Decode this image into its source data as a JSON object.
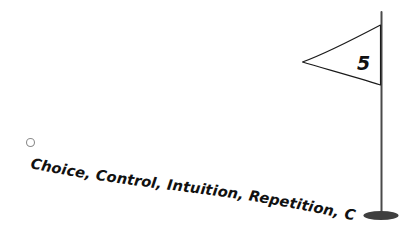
{
  "scene": {
    "title": "Golf hole illustration with curved caption",
    "background_color": "#ffffff",
    "width": 412,
    "height": 240
  },
  "caption": {
    "text": "Choice, Control, Intuition, Repetition, Correctness, Natural",
    "color": "#111111",
    "style": "bold-italic-curved"
  },
  "flag": {
    "number": "5",
    "number_color": "#111111",
    "outline_color": "#1a1a1a",
    "fill_color": "#ffffff"
  },
  "pole": {
    "color": "#4a4a4a",
    "base_color": "#3f3f3f"
  },
  "ball": {
    "label": "golf-ball",
    "outline_color": "#8c8c8c",
    "fill_color": "#ffffff"
  }
}
